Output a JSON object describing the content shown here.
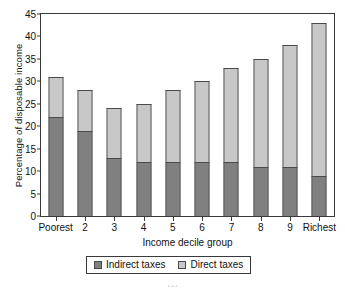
{
  "chart_data": {
    "type": "bar",
    "stacked": true,
    "title": "",
    "xlabel": "Income decile group",
    "ylabel": "Percentage of disposable income",
    "categories": [
      "Poorest",
      "2",
      "3",
      "4",
      "5",
      "6",
      "7",
      "8",
      "9",
      "Richest"
    ],
    "series": [
      {
        "name": "Indirect taxes",
        "color": "#808080",
        "values": [
          22,
          19,
          13,
          12,
          12,
          12,
          12,
          11,
          11,
          9
        ]
      },
      {
        "name": "Direct taxes",
        "color": "#c8c8c8",
        "values": [
          9,
          9,
          11,
          13,
          16,
          18,
          21,
          24,
          27,
          34
        ]
      }
    ],
    "totals": [
      31,
      28,
      24,
      25,
      28,
      30,
      33,
      35,
      38,
      43
    ],
    "ylim": [
      0,
      45
    ],
    "yticks": [
      0,
      5,
      10,
      15,
      20,
      25,
      30,
      35,
      40,
      45
    ],
    "ytick_labels": [
      "0",
      "5",
      "10",
      "15",
      "20",
      "25",
      "30",
      "35",
      "40",
      "45"
    ],
    "grid": false,
    "legend_position": "bottom-center"
  },
  "legend": {
    "items": [
      {
        "label": "Indirect taxes",
        "color": "#808080"
      },
      {
        "label": "Direct taxes",
        "color": "#c8c8c8"
      }
    ]
  },
  "caption": "…"
}
